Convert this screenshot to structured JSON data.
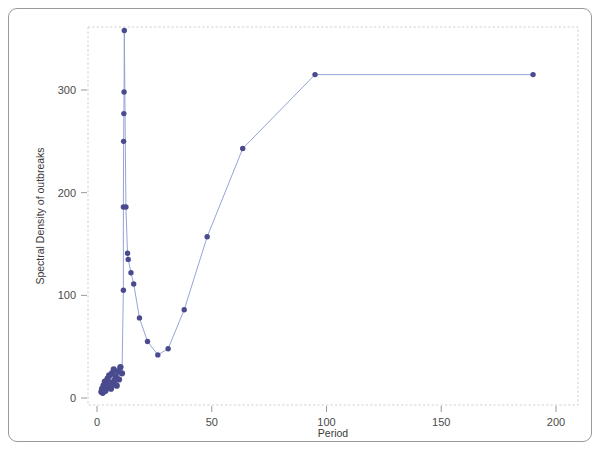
{
  "figure": {
    "caption_present": false,
    "background_color": "#ffffff",
    "border_color": "#9a9a9a"
  },
  "chart_data": {
    "type": "line",
    "title": "",
    "subtitle": "",
    "xlabel": "Period",
    "ylabel": "Spectral Density of outbreaks",
    "xlim": [
      0,
      200
    ],
    "ylim": [
      0,
      370
    ],
    "xticks": [
      0,
      50,
      100,
      150,
      200
    ],
    "xtick_labels": [
      "0",
      "50",
      "100",
      "150",
      "200"
    ],
    "yticks": [
      0,
      100,
      200,
      300
    ],
    "ytick_labels": [
      "0",
      "100",
      "200",
      "300"
    ],
    "grid": false,
    "legend": false,
    "legend_position": "none",
    "marker": "filled-circle",
    "marker_color": "#4a4a8e",
    "line_color": "#8f9fd4",
    "annotations": [],
    "series": [
      {
        "name": "Spectral density of outbreaks vs period",
        "points": [
          [
            1.9,
            6
          ],
          [
            2.2,
            9
          ],
          [
            2.5,
            5
          ],
          [
            2.8,
            12
          ],
          [
            3.1,
            8
          ],
          [
            3.4,
            16
          ],
          [
            3.7,
            7
          ],
          [
            4.0,
            14
          ],
          [
            4.3,
            10
          ],
          [
            4.6,
            19
          ],
          [
            4.9,
            11
          ],
          [
            5.3,
            22
          ],
          [
            5.7,
            15
          ],
          [
            6.1,
            9
          ],
          [
            6.5,
            24
          ],
          [
            6.9,
            13
          ],
          [
            7.3,
            28
          ],
          [
            7.7,
            17
          ],
          [
            8.1,
            21
          ],
          [
            8.6,
            12
          ],
          [
            9.1,
            26
          ],
          [
            9.6,
            18
          ],
          [
            10.2,
            30
          ],
          [
            10.9,
            24
          ],
          [
            11.5,
            105
          ],
          [
            11.5,
            186
          ],
          [
            11.6,
            250
          ],
          [
            11.7,
            277
          ],
          [
            11.8,
            298
          ],
          [
            11.9,
            358
          ],
          [
            12.6,
            186
          ],
          [
            13.3,
            141
          ],
          [
            13.6,
            135
          ],
          [
            14.8,
            122
          ],
          [
            16.0,
            111
          ],
          [
            18.5,
            78
          ],
          [
            22.0,
            55
          ],
          [
            26.5,
            42
          ],
          [
            31.0,
            48
          ],
          [
            38.0,
            86
          ],
          [
            48.0,
            157
          ],
          [
            63.5,
            243
          ],
          [
            95.0,
            315
          ],
          [
            190.0,
            315
          ]
        ]
      }
    ]
  }
}
